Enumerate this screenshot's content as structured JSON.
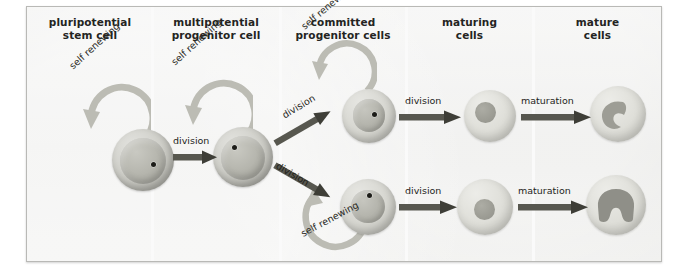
{
  "figure": {
    "background_color": "#ececeb",
    "border_color": "#b9b9b6"
  },
  "columns": [
    {
      "id": "pluripotential-stem-cell",
      "line1": "pluripotential",
      "line2": "stem cell"
    },
    {
      "id": "multipotential-progenitor-cell",
      "line1": "multipotential",
      "line2": "progenitor cell"
    },
    {
      "id": "committed-progenitor-cells",
      "line1": "committed",
      "line2": "progenitor cells"
    },
    {
      "id": "maturing-cells",
      "line1": "maturing",
      "line2": "cells"
    },
    {
      "id": "mature-cells",
      "line1": "mature",
      "line2": "cells"
    }
  ],
  "labels": {
    "self_renewing": "self renewing",
    "division": "division",
    "maturation": "maturation"
  },
  "cells": [
    {
      "id": "pluripotential-stem-cell",
      "stage": "pluripotential stem cell",
      "nucleus": "large-round",
      "nucleolus": true
    },
    {
      "id": "multipotential-progenitor-cell",
      "stage": "multipotential progenitor cell",
      "nucleus": "large-round",
      "nucleolus": true
    },
    {
      "id": "committed-progenitor-cell-top",
      "stage": "committed progenitor cell",
      "nucleus": "medium-round",
      "nucleolus": true
    },
    {
      "id": "committed-progenitor-cell-bottom",
      "stage": "committed progenitor cell",
      "nucleus": "medium-round",
      "nucleolus": true
    },
    {
      "id": "maturing-cell-top",
      "stage": "maturing cell",
      "nucleus": "small-round",
      "nucleolus": false
    },
    {
      "id": "maturing-cell-bottom",
      "stage": "maturing cell",
      "nucleus": "small-round",
      "nucleolus": false
    },
    {
      "id": "mature-cell-top",
      "stage": "mature cell",
      "nucleus": "kidney-shaped",
      "nucleolus": false
    },
    {
      "id": "mature-cell-bottom",
      "stage": "mature cell",
      "nucleus": "horseshoe-bilobed",
      "nucleolus": false
    }
  ],
  "arrows": {
    "self_renewing_loops": 3,
    "division_arrows": 5,
    "maturation_arrows": 2
  },
  "colors": {
    "arrow": "#57574f",
    "renew_arrow": "#bcbcb4",
    "text": "#24241f"
  }
}
